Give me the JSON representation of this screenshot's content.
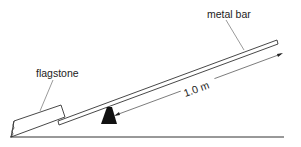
{
  "diagram": {
    "labels": {
      "metal_bar": "metal bar",
      "flagstone": "flagstone",
      "distance": "1.0 m"
    },
    "colors": {
      "line": "#333333",
      "fill": "#111111",
      "background": "#ffffff"
    }
  }
}
